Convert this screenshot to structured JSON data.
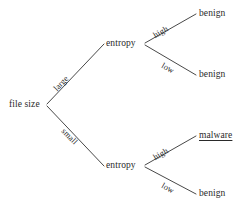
{
  "diagram": {
    "type": "decision-tree",
    "background_color": "#ffffff",
    "line_color": "#333333",
    "text_color": "#2a2a2a",
    "root": {
      "label": "file size"
    },
    "internal_nodes": [
      {
        "id": "entropy-top",
        "label": "entropy"
      },
      {
        "id": "entropy-bottom",
        "label": "entropy"
      }
    ],
    "edge_labels": {
      "root_upper": "large",
      "root_lower": "small",
      "top_upper": "high",
      "top_lower": "low",
      "bottom_upper": "high",
      "bottom_lower": "low"
    },
    "leaves": [
      {
        "id": "leaf-1",
        "label": "benign",
        "underlined": false
      },
      {
        "id": "leaf-2",
        "label": "benign",
        "underlined": false
      },
      {
        "id": "leaf-3",
        "label": "malware",
        "underlined": true
      },
      {
        "id": "leaf-4",
        "label": "benign",
        "underlined": false
      }
    ]
  }
}
